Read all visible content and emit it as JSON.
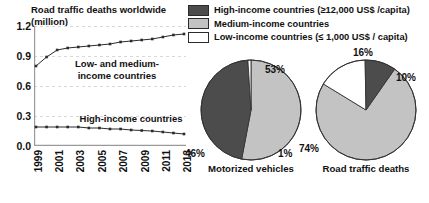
{
  "chart_data": [
    {
      "type": "line",
      "title": "Road traffic deaths worldwide (million)",
      "xlabel": "",
      "ylabel": "",
      "ylim": [
        0.0,
        1.2
      ],
      "yticks": [
        "0.0",
        "0.3",
        "0.6",
        "0.9",
        "1.2"
      ],
      "grid": true,
      "x": [
        1999,
        2000,
        2001,
        2002,
        2003,
        2004,
        2005,
        2006,
        2007,
        2008,
        2009,
        2010,
        2011,
        2012,
        2013
      ],
      "xticks": [
        "1999",
        "2001",
        "2003",
        "2005",
        "2007",
        "2009",
        "2011",
        "2013"
      ],
      "series": [
        {
          "name": "Low- and medium-income countries",
          "label_line1": "Low- and medium-",
          "label_line2": "income countries",
          "values": [
            0.8,
            0.89,
            0.96,
            0.98,
            0.99,
            1.0,
            1.01,
            1.02,
            1.04,
            1.05,
            1.06,
            1.07,
            1.09,
            1.11,
            1.12
          ]
        },
        {
          "name": "High-income countries",
          "label_line1": "High-income countries",
          "label_line2": "",
          "values": [
            0.19,
            0.19,
            0.19,
            0.19,
            0.19,
            0.18,
            0.18,
            0.17,
            0.17,
            0.16,
            0.155,
            0.15,
            0.14,
            0.13,
            0.12
          ]
        }
      ]
    },
    {
      "type": "pie",
      "title": "Motorized vehicles",
      "labels": [
        "Medium-income countries",
        "High-income countries",
        "Low-income countries"
      ],
      "values": [
        53,
        46,
        1
      ],
      "value_labels": [
        "53%",
        "46%",
        "1%"
      ],
      "colors": [
        "#c3c3c3",
        "#4c4c4c",
        "#ffffff"
      ]
    },
    {
      "type": "pie",
      "title": "Road traffic deaths",
      "labels": [
        "Medium-income countries",
        "Low-income countries",
        "High-income countries"
      ],
      "values": [
        74,
        16,
        10
      ],
      "value_labels": [
        "74%",
        "16%",
        "10%"
      ],
      "colors": [
        "#c3c3c3",
        "#ffffff",
        "#4c4c4c"
      ]
    }
  ],
  "legend": {
    "items": [
      {
        "label": "High-income countries (≥12,000 US$ /capita)",
        "color": "#4c4c4c",
        "swatch_name": "swatch-high-income"
      },
      {
        "label": "Medium-income countries",
        "color": "#c3c3c3",
        "swatch_name": "swatch-medium-income"
      },
      {
        "label": "Low-income countries (≤ 1,000 US$ / capita)",
        "color": "#ffffff",
        "swatch_name": "swatch-low-income"
      }
    ]
  },
  "colors": {
    "high_income": "#4c4c4c",
    "medium_income": "#c3c3c3",
    "low_income": "#ffffff",
    "axis": "#9a9a9a",
    "grid": "#d8d8d8",
    "line": "#2b2b2b",
    "text": "#111111"
  }
}
